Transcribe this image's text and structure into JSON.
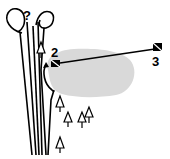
{
  "diagram": {
    "question_mark": "?",
    "markers": [
      {
        "id": "marker-2",
        "label": "2"
      },
      {
        "id": "marker-3",
        "label": "3"
      }
    ],
    "colors": {
      "ink": "#000000",
      "area_fill": "#d9d9d9",
      "background": "#ffffff"
    },
    "tree_count": 8
  }
}
